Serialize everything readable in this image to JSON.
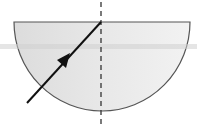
{
  "diagram": {
    "block": {
      "fill": "#e6e6e6",
      "stroke": "#555555"
    },
    "ray": {
      "color": "#111111",
      "direction": "toward center of flat face"
    },
    "normal": {
      "style": "dashed",
      "color": "#333333"
    },
    "artifact_band_color": "#cfcfcf"
  }
}
